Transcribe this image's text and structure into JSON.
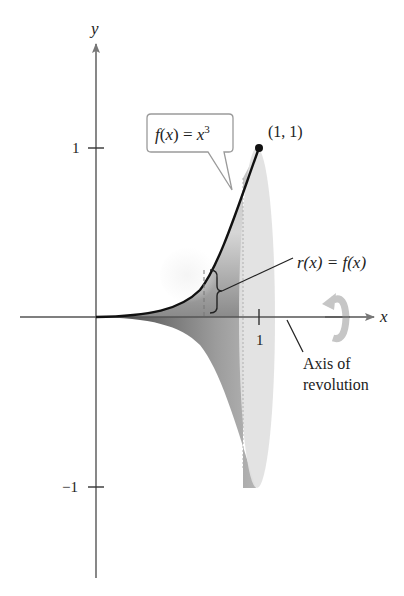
{
  "diagram": {
    "axes": {
      "x_label": "x",
      "y_label": "y",
      "x_ticks": [
        {
          "value": 1,
          "label": "1"
        }
      ],
      "y_ticks": [
        {
          "value": 1,
          "label": "1"
        },
        {
          "value": -1,
          "label": "−1"
        }
      ]
    },
    "curve": {
      "label_f": "f",
      "label_open": "(",
      "label_x": "x",
      "label_close": ")",
      "label_eq": " = ",
      "label_base": "x",
      "label_exp": "3",
      "full_label": "f(x) = x^3"
    },
    "point": {
      "label": "(1, 1)",
      "x": 1,
      "y": 1
    },
    "radius_annotation": {
      "label": "r(x) = f(x)",
      "r": "r",
      "fx": "f",
      "x": "x"
    },
    "axis_annotation": {
      "line1": "Axis of",
      "line2": "revolution"
    },
    "icons": {
      "rotation": "rotation-arrow-icon"
    },
    "colors": {
      "ink": "#222222",
      "axis": "#555555",
      "solid_dark": "#6e6e6e",
      "solid_mid": "#a8a8a8",
      "solid_light": "#dedede",
      "ellipse": "#e4e4e4",
      "callout_border": "#9a9a9a",
      "rotation_arrow": "#c8c8c8"
    }
  }
}
